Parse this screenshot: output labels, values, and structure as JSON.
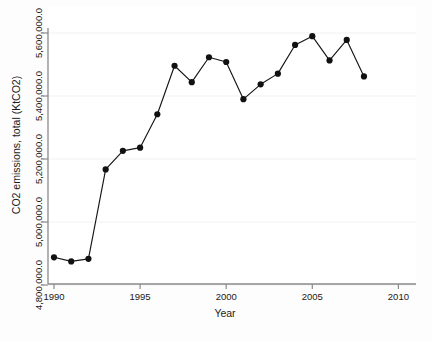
{
  "chart_data": {
    "type": "line",
    "title": "",
    "xlabel": "Year",
    "ylabel": "CO2 emissions, total (KtCO2)",
    "xlim": [
      1989.2,
      2011.3
    ],
    "ylim": [
      4800000.0,
      5650000.0
    ],
    "grid": true,
    "legend": null,
    "marker": "filled-circle",
    "x_ticks": [
      "1990",
      "1995",
      "2000",
      "2005",
      "2010"
    ],
    "x_tick_values": [
      1990,
      1995,
      2000,
      2005,
      2010
    ],
    "y_ticks": [
      "4,800,000.0",
      "5,000,000.0",
      "5,200,000.0",
      "5,400,000.0",
      "5,600,000.0"
    ],
    "y_tick_values": [
      4800000.0,
      5000000.0,
      5200000.0,
      5400000.0,
      5600000.0
    ],
    "x": [
      1990,
      1991,
      1992,
      1993,
      1994,
      1995,
      1996,
      1997,
      1998,
      1999,
      2000,
      2001,
      2002,
      2003,
      2004,
      2005,
      2006,
      2007,
      2008
    ],
    "values": [
      4888000,
      4875000,
      4883000,
      5167000,
      5226000,
      5236000,
      5342000,
      5496000,
      5444000,
      5523000,
      5508000,
      5390000,
      5437000,
      5471000,
      5562000,
      5590000,
      5513000,
      5578000,
      5462000
    ],
    "series": [
      {
        "name": "CO2 emissions, total (KtCO2)",
        "values": [
          4888000,
          4875000,
          4883000,
          5167000,
          5226000,
          5236000,
          5342000,
          5496000,
          5444000,
          5523000,
          5508000,
          5390000,
          5437000,
          5471000,
          5562000,
          5590000,
          5513000,
          5578000,
          5462000
        ]
      }
    ],
    "colors": {
      "line": "#161616",
      "marker": "#111111",
      "grid": "#f1f1f1",
      "axis": "#8a8a8a",
      "background": "#ffffff"
    }
  }
}
